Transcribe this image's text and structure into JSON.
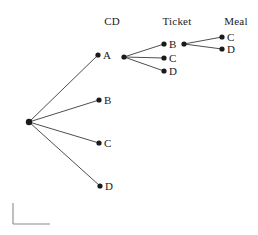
{
  "figure": {
    "type": "tree-diagram",
    "background_color": "#ffffff",
    "line_color": "#3a3a3a",
    "node_color": "#1a1a1a",
    "text_color": "#1a1a1a",
    "axis_mark_color": "#8a8a8a"
  },
  "columns": [
    {
      "key": "cd",
      "label": "CD",
      "x": 112,
      "y": 21
    },
    {
      "key": "ticket",
      "label": "Ticket",
      "x": 177,
      "y": 21
    },
    {
      "key": "meal",
      "label": "Meal",
      "x": 236,
      "y": 21
    }
  ],
  "nodes": [
    {
      "id": "root",
      "label": "",
      "x": 29,
      "y": 122,
      "r": 3.2,
      "label_dx": 0,
      "level": 0
    },
    {
      "id": "cd-A",
      "label": "A",
      "x": 98,
      "y": 55,
      "r": 2.6,
      "label_dx": 5,
      "level": 1
    },
    {
      "id": "cd-B",
      "label": "B",
      "x": 99,
      "y": 100,
      "r": 2.6,
      "label_dx": 5,
      "level": 1
    },
    {
      "id": "cd-C",
      "label": "C",
      "x": 99,
      "y": 143,
      "r": 2.6,
      "label_dx": 5,
      "level": 1
    },
    {
      "id": "cd-D",
      "label": "D",
      "x": 100,
      "y": 186,
      "r": 2.6,
      "label_dx": 5,
      "level": 1
    },
    {
      "id": "cd-A-hub",
      "label": "",
      "x": 124,
      "y": 57,
      "r": 2.6,
      "label_dx": 0,
      "level": 1
    },
    {
      "id": "tk-B",
      "label": "B",
      "x": 164,
      "y": 44,
      "r": 2.6,
      "label_dx": 5,
      "level": 2
    },
    {
      "id": "tk-C",
      "label": "C",
      "x": 164,
      "y": 58,
      "r": 2.6,
      "label_dx": 5,
      "level": 2
    },
    {
      "id": "tk-D",
      "label": "D",
      "x": 164,
      "y": 71,
      "r": 2.6,
      "label_dx": 5,
      "level": 2
    },
    {
      "id": "tk-B-hub",
      "label": "",
      "x": 184,
      "y": 44,
      "r": 2.6,
      "label_dx": 0,
      "level": 2
    },
    {
      "id": "ml-C",
      "label": "C",
      "x": 222,
      "y": 37,
      "r": 2.6,
      "label_dx": 5,
      "level": 3
    },
    {
      "id": "ml-D",
      "label": "D",
      "x": 222,
      "y": 49,
      "r": 2.6,
      "label_dx": 5,
      "level": 3
    }
  ],
  "edges": [
    {
      "from": "root",
      "to": "cd-A"
    },
    {
      "from": "root",
      "to": "cd-B"
    },
    {
      "from": "root",
      "to": "cd-C"
    },
    {
      "from": "root",
      "to": "cd-D"
    },
    {
      "from": "cd-A-hub",
      "to": "tk-B"
    },
    {
      "from": "cd-A-hub",
      "to": "tk-C"
    },
    {
      "from": "cd-A-hub",
      "to": "tk-D"
    },
    {
      "from": "tk-B-hub",
      "to": "ml-C"
    },
    {
      "from": "tk-B-hub",
      "to": "ml-D"
    }
  ],
  "axis_mark": {
    "vertical": {
      "x1": 13,
      "y1": 203,
      "x2": 13,
      "y2": 224
    },
    "horizontal": {
      "x1": 13,
      "y1": 224,
      "x2": 50,
      "y2": 224
    }
  }
}
